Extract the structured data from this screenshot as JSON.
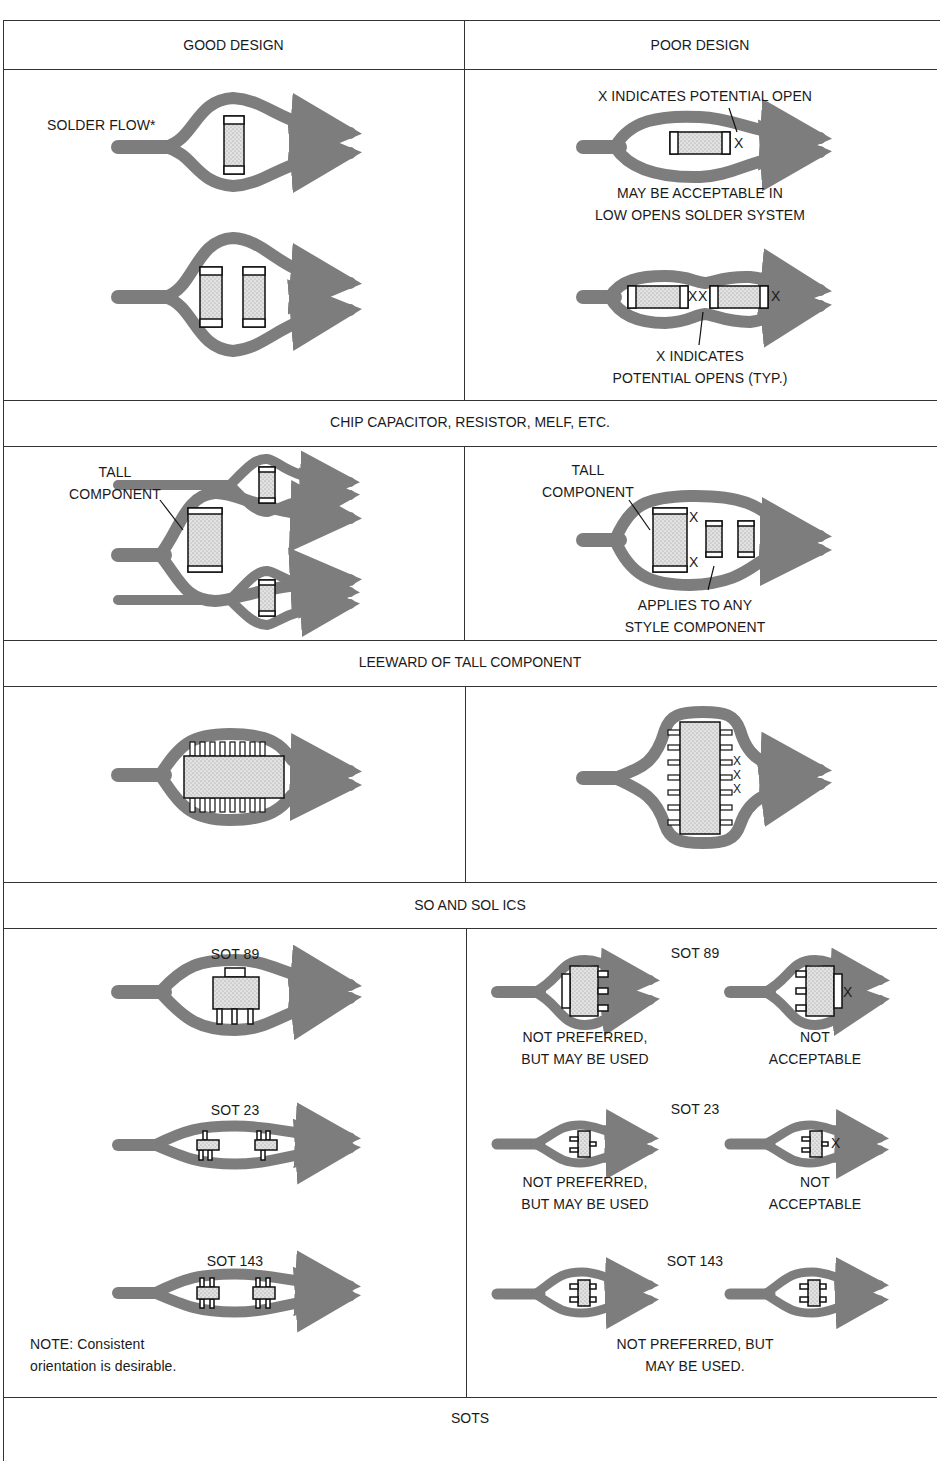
{
  "columns": {
    "good": "GOOD DESIGN",
    "poor": "POOR DESIGN"
  },
  "sections": [
    {
      "title": "CHIP CAPACITOR, RESISTOR, MELF, ETC.",
      "good": {
        "labels": [
          "SOLDER FLOW*"
        ]
      },
      "poor": {
        "labels": [
          "X INDICATES POTENTIAL OPEN",
          "MAY BE ACCEPTABLE IN",
          "LOW OPENS SOLDER SYSTEM",
          "X INDICATES",
          "POTENTIAL OPENS (TYP.)"
        ],
        "marks": [
          "X",
          "X",
          "X",
          "X"
        ]
      }
    },
    {
      "title": "LEEWARD OF TALL COMPONENT",
      "good": {
        "labels": [
          "TALL",
          "COMPONENT"
        ]
      },
      "poor": {
        "labels": [
          "TALL",
          "COMPONENT",
          "APPLIES TO ANY",
          "STYLE COMPONENT"
        ],
        "marks": [
          "X",
          "X"
        ]
      }
    },
    {
      "title": "SO AND SOL ICS",
      "good": {
        "labels": []
      },
      "poor": {
        "labels": [],
        "marks": [
          "X",
          "X",
          "X"
        ]
      }
    },
    {
      "title": "SOTS",
      "good": {
        "labels": [
          "SOT 89",
          "SOT 23",
          "SOT 143",
          "NOTE: Consistent",
          "orientation is desirable."
        ]
      },
      "poor": {
        "labels": [
          "SOT 89",
          "NOT PREFERRED,",
          "BUT MAY BE USED",
          "NOT",
          "ACCEPTABLE",
          "SOT 23",
          "NOT PREFERRED,",
          "BUT MAY BE USED",
          "NOT",
          "ACCEPTABLE",
          "SOT 143",
          "NOT PREFERRED, BUT",
          "MAY BE USED."
        ],
        "marks": [
          "X",
          "X"
        ]
      }
    }
  ],
  "colors": {
    "solder": "#7d7d7d",
    "component_fill": "#d9d9d9",
    "line": "#333333"
  }
}
